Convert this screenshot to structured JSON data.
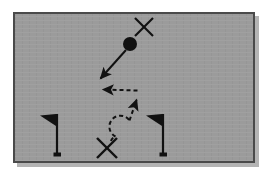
{
  "diagram": {
    "field": {
      "background_color": "#9b9b9b",
      "border_color": "#4a4a4a",
      "shadow_color": "#b4b4b4",
      "outer_background": "#ffffff",
      "x": 13,
      "y": 12,
      "width": 242,
      "height": 151
    },
    "ink_color": "#111111",
    "markers": [
      {
        "id": "offensive-player-ball",
        "label": "ball-carrier",
        "symbol": "filled-circle",
        "x": 130,
        "y": 44,
        "radius": 7
      },
      {
        "id": "defender-top",
        "label": "defender-upper",
        "symbol": "x-mark",
        "x": 144,
        "y": 27,
        "size": 9
      },
      {
        "id": "defender-bottom",
        "label": "defender-lower",
        "symbol": "x-mark",
        "x": 107,
        "y": 148,
        "size": 10
      }
    ],
    "flags": [
      {
        "id": "flag-left",
        "label": "left-marker-flag",
        "pole_x": 57,
        "top_y": 114,
        "base_y": 156,
        "pennant_direction": "left",
        "pennant_width": 17,
        "pennant_height": 12
      },
      {
        "id": "flag-right",
        "label": "right-marker-flag",
        "pole_x": 163,
        "top_y": 114,
        "base_y": 156,
        "pennant_direction": "left",
        "pennant_width": 17,
        "pennant_height": 12
      }
    ],
    "paths": [
      {
        "id": "solid-run-path",
        "label": "ball-carrier-run",
        "style": "solid",
        "stroke_width": 2,
        "arrowhead": "end",
        "points": "126,50 99,80"
      },
      {
        "id": "dashed-route-path",
        "label": "defender-pursuit-route",
        "style": "dashed",
        "dash_pattern": "4,3",
        "stroke_width": 2,
        "arrowhead": "both-segments",
        "loop": {
          "center_x": 125,
          "center_y": 127,
          "radius": 11
        },
        "segments": [
          "111,141 116,136",
          "130,118 138,100",
          "136,92 102,90"
        ]
      }
    ],
    "legend_note": ""
  }
}
